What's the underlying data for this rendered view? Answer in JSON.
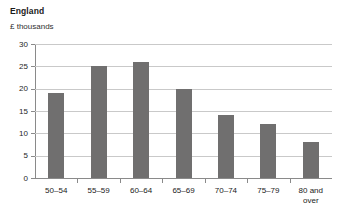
{
  "chart_data": {
    "type": "bar",
    "title": "England",
    "subtitle": "£ thousands",
    "xlabel": "",
    "ylabel": "£ thousands",
    "categories": [
      "50–54",
      "55–59",
      "60–64",
      "65–69",
      "70–74",
      "75–79",
      "80 and over"
    ],
    "category_labels_display": [
      {
        "line1": "50–54",
        "line2": ""
      },
      {
        "line1": "55–59",
        "line2": ""
      },
      {
        "line1": "60–64",
        "line2": ""
      },
      {
        "line1": "65–69",
        "line2": ""
      },
      {
        "line1": "70–74",
        "line2": ""
      },
      {
        "line1": "75–79",
        "line2": ""
      },
      {
        "line1": "80 and",
        "line2": "over"
      }
    ],
    "values": [
      19,
      25,
      26,
      20,
      14,
      12,
      8
    ],
    "ylim": [
      0,
      30
    ],
    "yticks": [
      0,
      5,
      10,
      15,
      20,
      25,
      30
    ],
    "ytick_labels": [
      "0",
      "5",
      "10",
      "15",
      "20",
      "25",
      "30"
    ],
    "grid": true,
    "legend": false,
    "legend_position": "none",
    "bar_color": "#706f6f",
    "gridline_color": "#c9c9c9",
    "axis_color": "#8a8a8a",
    "background_color": "#ffffff"
  }
}
